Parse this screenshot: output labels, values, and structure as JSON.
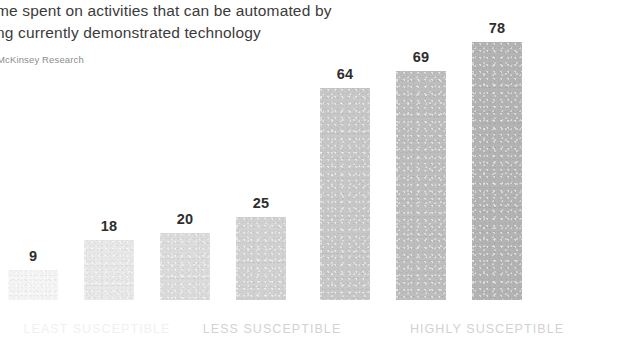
{
  "header": {
    "title_line_1": "me spent on activities that can be automated by",
    "title_line_2": "ng currently demonstrated technology",
    "subtitle": "McKinsey Research"
  },
  "chart_data": {
    "type": "bar",
    "title": "me spent on activities that can be automated by ng currently demonstrated technology",
    "subtitle": "McKinsey Research",
    "xlabel": "",
    "ylabel": "",
    "ylim": [
      0,
      85
    ],
    "grid": false,
    "legend": "none",
    "orientation": "vertical",
    "categories": [
      "",
      "",
      "",
      "",
      "",
      "",
      ""
    ],
    "values": [
      9,
      18,
      20,
      25,
      64,
      69,
      78
    ],
    "bar_colors": [
      "#f5f5f5",
      "#e8e8e8",
      "#dcdcdc",
      "#d2d2d2",
      "#c8c8c8",
      "#bebebe",
      "#b4b4b4"
    ],
    "value_labels": [
      "9",
      "18",
      "20",
      "25",
      "64",
      "69",
      "78"
    ],
    "groups": [
      {
        "label": "LEAST SUSCEPTIBLE",
        "bar_indices": [
          0,
          1
        ],
        "faded": true
      },
      {
        "label": "LESS SUSCEPTIBLE",
        "bar_indices": [
          2,
          3
        ],
        "faded": false
      },
      {
        "label": "HIGHLY SUSCEPTIBLE",
        "bar_indices": [
          4,
          5,
          6
        ],
        "faded": false
      }
    ]
  },
  "bars": [
    {
      "value_label": "9",
      "x": 8,
      "width": 50,
      "height_px": 30,
      "color": "#f5f5f5",
      "label_bottom": 36
    },
    {
      "value_label": "18",
      "x": 84,
      "width": 50,
      "height_px": 60,
      "color": "#e8e8e8",
      "label_bottom": 66
    },
    {
      "value_label": "20",
      "x": 160,
      "width": 50,
      "height_px": 67,
      "color": "#dcdcdc",
      "label_bottom": 73
    },
    {
      "value_label": "25",
      "x": 236,
      "width": 50,
      "height_px": 83,
      "color": "#d2d2d2",
      "label_bottom": 89
    },
    {
      "value_label": "64",
      "x": 320,
      "width": 50,
      "height_px": 212,
      "color": "#c8c8c8",
      "label_bottom": 218
    },
    {
      "value_label": "69",
      "x": 396,
      "width": 50,
      "height_px": 229,
      "color": "#bebebe",
      "label_bottom": 235
    },
    {
      "value_label": "78",
      "x": 472,
      "width": 50,
      "height_px": 258,
      "color": "#b4b4b4",
      "label_bottom": 264
    }
  ],
  "category_labels": [
    {
      "text": "LEAST SUSCEPTIBLE",
      "center_x": 97,
      "faded": true
    },
    {
      "text": "LESS SUSCEPTIBLE",
      "center_x": 272,
      "faded": false
    },
    {
      "text": "HIGHLY SUSCEPTIBLE",
      "center_x": 487,
      "faded": false
    }
  ]
}
